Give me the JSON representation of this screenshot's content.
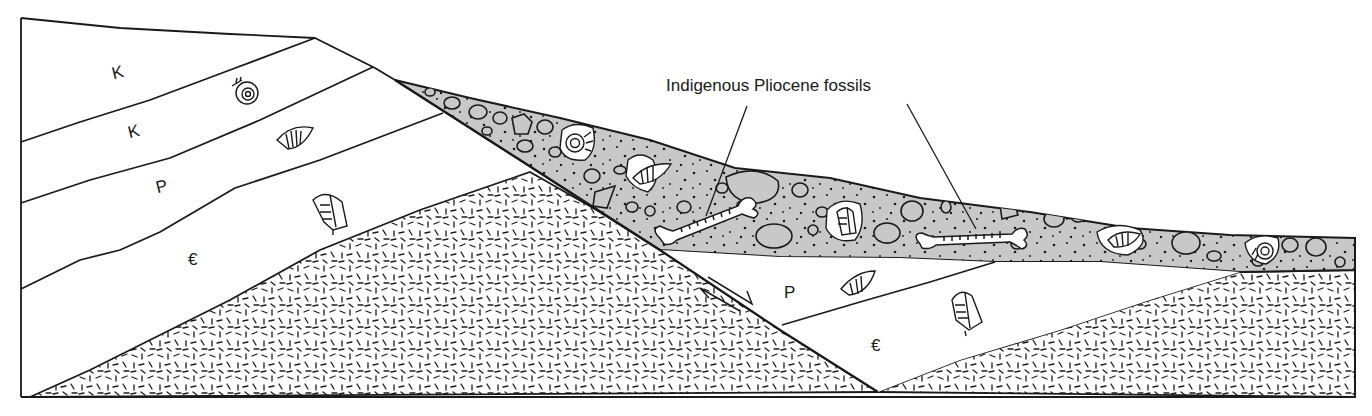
{
  "diagram": {
    "type": "geologic cross-section",
    "callout": {
      "text": "Indigenous Pliocene fossils",
      "targets": [
        "bone-fossil-left",
        "bone-fossil-right"
      ]
    },
    "units": [
      {
        "id": "K1",
        "label": "K",
        "block": "upthrown-left",
        "fossil": "ammonite"
      },
      {
        "id": "K2",
        "label": "K",
        "block": "upthrown-left",
        "fossil": "brachiopod"
      },
      {
        "id": "P1",
        "label": "P",
        "block": "upthrown-left",
        "fossil": "trilobite"
      },
      {
        "id": "C1",
        "label": "€",
        "block": "upthrown-left"
      },
      {
        "id": "P2",
        "label": "P",
        "block": "downthrown-right",
        "fossil": "brachiopod"
      },
      {
        "id": "C2",
        "label": "€",
        "block": "downthrown-right",
        "fossil": "trilobite"
      }
    ],
    "conglomerate": {
      "fill": "#c8c8c8",
      "reworked_fossils": [
        "ammonite",
        "brachiopod",
        "trilobite",
        "brachiopod",
        "ammonite"
      ],
      "indigenous_fossils": [
        "bone",
        "bone"
      ]
    },
    "basement": {
      "pattern": "dashes"
    },
    "fault": {
      "motion_arrows": true
    },
    "colors": {
      "line": "#1a1a1a",
      "fill_conglomerate": "#c8c8c8",
      "background": "#ffffff"
    }
  }
}
